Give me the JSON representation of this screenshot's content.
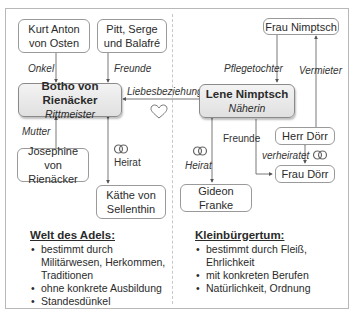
{
  "nodes": {
    "kurt": "Kurt Anton von Osten",
    "kurt_l1": "Kurt Anton",
    "kurt_l2": "von Osten",
    "pitt_l1": "Pitt, Serge",
    "pitt_l2": "und Balafré",
    "botho_name": "Botho von Rienäcker",
    "botho_role": "Rittmeister",
    "josephine_l1": "Josephine",
    "josephine_l2": "von Rienäcker",
    "kaethe_l1": "Käthe von",
    "kaethe_l2": "Sellenthin",
    "lene_name": "Lene Nimptsch",
    "lene_role": "Näherin",
    "frau_nimptsch": "Frau Nimptsch",
    "herr_doerr": "Herr Dörr",
    "frau_doerr": "Frau Dörr",
    "gideon": "Gideon Franke"
  },
  "relations": {
    "onkel": "Onkel",
    "freunde_left": "Freunde",
    "liebesbeziehung": "Liebesbeziehung",
    "mutter": "Mutter",
    "heirat_left": "Heirat",
    "pflegetochter": "Pflegetochter",
    "vermieter": "Vermieter",
    "freunde_right": "Freunde",
    "heirat_right": "Heirat",
    "verheiratet": "verheiratet"
  },
  "icons": {
    "heart": "heart-icon",
    "rings": "wedding-rings-icon"
  },
  "sections": {
    "adel": {
      "title": "Welt des Adels:",
      "items": [
        "bestimmt durch Militärwesen, Herkommen, Traditionen",
        "ohne konkrete Ausbildung",
        "Standesdünkel"
      ]
    },
    "klein": {
      "title": "Kleinbürgertum:",
      "items": [
        "bestimmt durch Fleiß, Ehrlichkeit",
        "mit konkreten Berufen",
        "Natürlichkeit, Ordnung"
      ]
    }
  },
  "colors": {
    "border": "#9a9a9a",
    "main_box_top": "#f3f3f3",
    "main_box_bottom": "#e0e0e0",
    "line": "#555555"
  }
}
